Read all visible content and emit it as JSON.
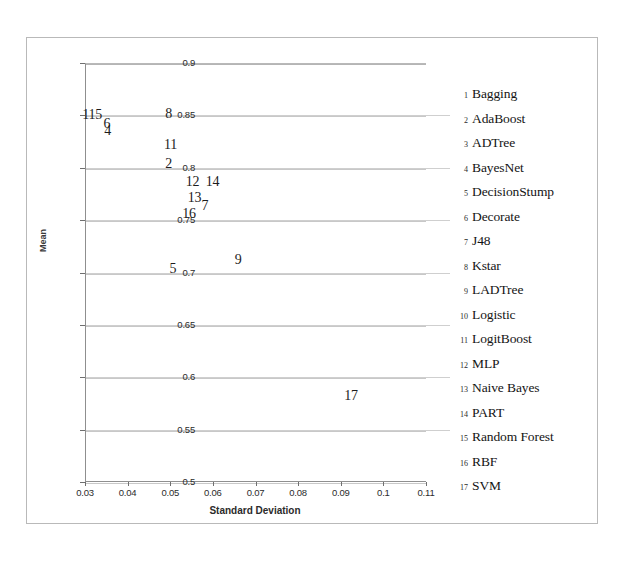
{
  "chart_data": {
    "type": "scatter",
    "title": "",
    "xlabel": "Standard Deviation",
    "ylabel": "Mean",
    "xlim": [
      0.03,
      0.11
    ],
    "ylim": [
      0.5,
      0.9
    ],
    "xticks": [
      "0.03",
      "0.04",
      "0.05",
      "0.06",
      "0.07",
      "0.08",
      "0.09",
      "0.1",
      "0.11"
    ],
    "xtick_values": [
      0.03,
      0.04,
      0.05,
      0.06,
      0.07,
      0.08,
      0.09,
      0.1,
      0.11
    ],
    "yticks": [
      "0.9",
      "0.85",
      "0.8",
      "0.75",
      "0.7",
      "0.65",
      "0.6",
      "0.55",
      "0.5"
    ],
    "ytick_values": [
      0.9,
      0.85,
      0.8,
      0.75,
      0.7,
      0.65,
      0.6,
      0.55,
      0.5
    ],
    "grid": "horizontal",
    "legend_position": "right",
    "marker_style": "numeric-label",
    "points": [
      {
        "id": "1",
        "label": "1",
        "name": "Bagging",
        "x": 0.0305,
        "y": 0.851
      },
      {
        "id": "15",
        "label": "15",
        "name": "Random Forest",
        "x": 0.032,
        "y": 0.851
      },
      {
        "id": "6",
        "label": "6",
        "name": "Decorate",
        "x": 0.0355,
        "y": 0.843
      },
      {
        "id": "4",
        "label": "4",
        "name": "BayesNet",
        "x": 0.0357,
        "y": 0.836
      },
      {
        "id": "8",
        "label": "8",
        "name": "Kstar",
        "x": 0.05,
        "y": 0.852
      },
      {
        "id": "11",
        "label": "11",
        "name": "LogitBoost",
        "x": 0.0497,
        "y": 0.823
      },
      {
        "id": "2",
        "label": "2",
        "name": "AdaBoost",
        "x": 0.05,
        "y": 0.805
      },
      {
        "id": "12",
        "label": "12",
        "name": "MLP",
        "x": 0.0548,
        "y": 0.787
      },
      {
        "id": "14",
        "label": "14",
        "name": "PART",
        "x": 0.0595,
        "y": 0.787
      },
      {
        "id": "13",
        "label": "13",
        "name": "Naive Bayes",
        "x": 0.0553,
        "y": 0.772
      },
      {
        "id": "7",
        "label": "7",
        "name": "J48",
        "x": 0.0585,
        "y": 0.764
      },
      {
        "id": "16",
        "label": "16",
        "name": "RBF",
        "x": 0.054,
        "y": 0.757
      },
      {
        "id": "5",
        "label": "5",
        "name": "DecisionStump",
        "x": 0.051,
        "y": 0.704
      },
      {
        "id": "9",
        "label": "9",
        "name": "LADTree",
        "x": 0.0663,
        "y": 0.713
      },
      {
        "id": "17",
        "label": "17",
        "name": "SVM",
        "x": 0.092,
        "y": 0.583
      }
    ]
  },
  "legend": {
    "items": [
      {
        "num": "1",
        "label": "Bagging"
      },
      {
        "num": "2",
        "label": "AdaBoost"
      },
      {
        "num": "3",
        "label": "ADTree"
      },
      {
        "num": "4",
        "label": "BayesNet"
      },
      {
        "num": "5",
        "label": "DecisionStump"
      },
      {
        "num": "6",
        "label": "Decorate"
      },
      {
        "num": "7",
        "label": "J48"
      },
      {
        "num": "8",
        "label": "Kstar"
      },
      {
        "num": "9",
        "label": "LADTree"
      },
      {
        "num": "10",
        "label": "Logistic"
      },
      {
        "num": "11",
        "label": "LogitBoost"
      },
      {
        "num": "12",
        "label": "MLP"
      },
      {
        "num": "13",
        "label": "Naive Bayes"
      },
      {
        "num": "14",
        "label": "PART"
      },
      {
        "num": "15",
        "label": "Random Forest"
      },
      {
        "num": "16",
        "label": "RBF"
      },
      {
        "num": "17",
        "label": "SVM"
      }
    ]
  },
  "caption": {
    "text": ""
  },
  "colors": {
    "background": "#ffffff",
    "axis": "#8f8f8f",
    "grid": "#c8c8c8",
    "text": "#1a1a1a"
  }
}
